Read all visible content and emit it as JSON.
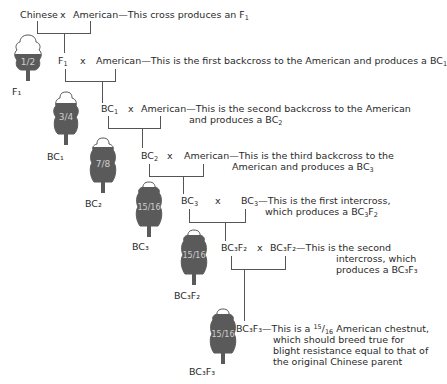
{
  "colors": {
    "tree_dark": "#5a5a5a",
    "tree_outline": "#444444",
    "line": "#555555",
    "text": "#2a2a2a"
  },
  "crosses": [
    {
      "parent1": "Chinese",
      "x": "x",
      "parent2": "American",
      "desc": "—This cross produces an F",
      "desc_sub": "1"
    },
    {
      "parent1": "F",
      "parent1_sub": "1",
      "x": "x",
      "parent2": "American",
      "desc": "—This is the first backcross to the American and produces a BC",
      "desc_sub": "1"
    },
    {
      "parent1": "BC",
      "parent1_sub": "1",
      "x": "x",
      "parent2": "American",
      "desc_line1": "—This is the second backcross to the American",
      "desc_line2": "and produces a BC",
      "desc_sub": "2"
    },
    {
      "parent1": "BC",
      "parent1_sub": "2",
      "x": "x",
      "parent2": "American",
      "desc_line1": "—This is the third backcross to the",
      "desc_line2": "American and produces a BC",
      "desc_sub": "3"
    },
    {
      "parent1": "BC",
      "parent1_sub": "3",
      "x": "x",
      "parent2": "BC",
      "parent2_sub": "3",
      "desc_line1": "—This is the first intercross,",
      "desc_line2": "which produces a BC",
      "desc_sub_a": "3",
      "desc_mid": "F",
      "desc_sub_b": "2"
    },
    {
      "parent1": "BC₃F₂",
      "x": "x",
      "parent2": "BC₃F₂",
      "desc_line1": "—This is the second",
      "desc_line2": "intercross, which",
      "desc_line3": "produces a BC₃F₃"
    },
    {
      "parent1": "BC₃F₃",
      "desc_line1": "—This is a",
      "desc_frac_num": "15",
      "desc_frac_den": "16",
      "desc_line1b": "American chestnut,",
      "desc_line2": "which should breed true for",
      "desc_line3": "blight resistance equal to that of",
      "desc_line4": "the original Chinese parent"
    }
  ],
  "trees": [
    {
      "fraction": "1/2",
      "label": "F₁"
    },
    {
      "fraction": "3/4",
      "label": "BC₁"
    },
    {
      "fraction": "7/8",
      "label": "BC₂"
    },
    {
      "fraction": "15/16",
      "label": "BC₃"
    },
    {
      "fraction": "15/16",
      "label": "BC₃F₂"
    },
    {
      "fraction": "15/16",
      "label": "BC₃F₃"
    }
  ]
}
